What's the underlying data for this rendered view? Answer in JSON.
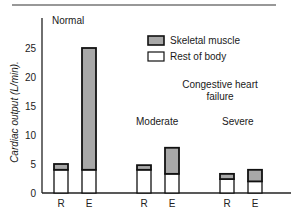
{
  "chart_data": {
    "type": "bar",
    "stacked": true,
    "title": "",
    "ylabel": "Cardiac output (L/min).",
    "xlabel": "",
    "ylim": [
      0,
      28
    ],
    "yticks": [
      0,
      5,
      10,
      15,
      20,
      25
    ],
    "grid": false,
    "legend_position": "upper-right (inside)",
    "legend": [
      {
        "name": "Skeletal muscle",
        "color": "#a8a8a8"
      },
      {
        "name": "Rest of body",
        "color": "#ffffff"
      }
    ],
    "groups": [
      {
        "label": "Normal",
        "categories": [
          "R",
          "E"
        ]
      },
      {
        "label": "Moderate",
        "categories": [
          "R",
          "E"
        ]
      },
      {
        "label": "Severe",
        "categories": [
          "R",
          "E"
        ]
      }
    ],
    "group_annotation": "Congestive heart failure",
    "categories": [
      "Normal R",
      "Normal E",
      "Moderate R",
      "Moderate E",
      "Severe R",
      "Severe E"
    ],
    "series": [
      {
        "name": "Rest of body",
        "values": [
          4.0,
          4.0,
          4.0,
          3.3,
          2.4,
          2.0
        ]
      },
      {
        "name": "Skeletal muscle",
        "values": [
          1.0,
          21.0,
          0.8,
          4.5,
          0.9,
          2.0
        ]
      }
    ],
    "totals": [
      5.0,
      25.0,
      4.8,
      7.8,
      3.3,
      4.0
    ]
  },
  "labels": {
    "normal": "Normal",
    "chf_line1": "Congestive heart",
    "chf_line2": "failure",
    "moderate": "Moderate",
    "severe": "Severe",
    "ylabel": "Cardiac output (L/min).",
    "legend_skeletal": "Skeletal muscle",
    "legend_rest": "Rest of body",
    "x_ticks": [
      "R",
      "E",
      "R",
      "E",
      "R",
      "E"
    ],
    "y_ticks": [
      "0",
      "5",
      "10",
      "15",
      "20",
      "25"
    ]
  }
}
